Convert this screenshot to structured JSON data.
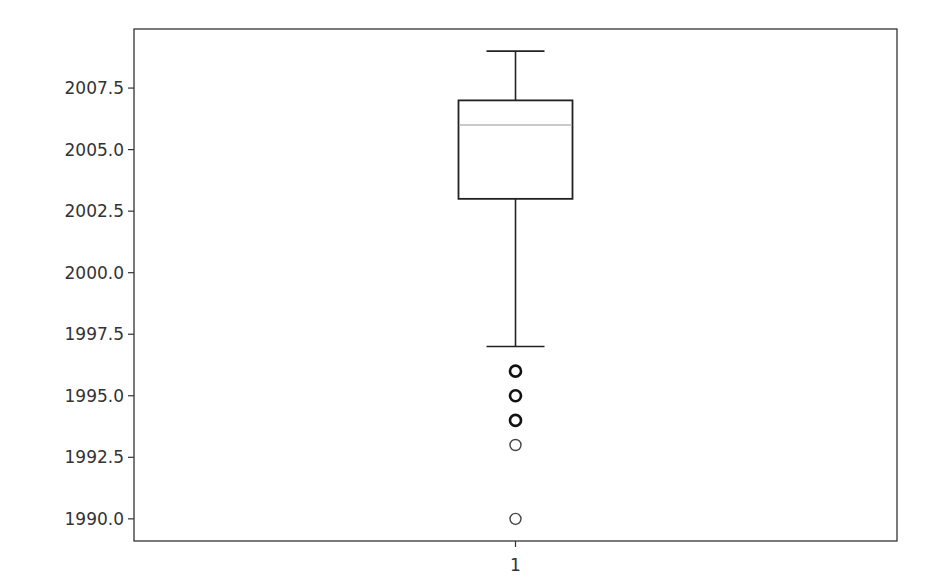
{
  "chart_data": {
    "type": "boxplot",
    "title": "",
    "xlabel": "",
    "ylabel": "",
    "categories": [
      "1"
    ],
    "ylim": [
      1989.1,
      2009.9
    ],
    "yticks": [
      1990.0,
      1992.5,
      1995.0,
      1997.5,
      2000.0,
      2002.5,
      2005.0,
      2007.5
    ],
    "ytick_labels": [
      "1990.0",
      "1992.5",
      "1995.0",
      "1997.5",
      "2000.0",
      "2002.5",
      "2005.0",
      "2007.5"
    ],
    "xtick_labels": [
      "1"
    ],
    "grid": false,
    "legend": null,
    "series": [
      {
        "name": "1",
        "whisker_low": 1997,
        "q1": 2003,
        "median": 2006,
        "q3": 2007,
        "whisker_high": 2009,
        "outliers": [
          1996,
          1995,
          1994,
          1993,
          1990
        ]
      }
    ],
    "colors": {
      "box": "#222222",
      "median": "#b8b8b8",
      "axes": "#333333",
      "text": "#333333"
    }
  }
}
